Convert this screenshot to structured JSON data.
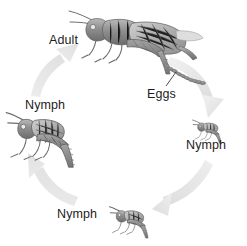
{
  "diagram": {
    "type": "life-cycle-diagram",
    "background_color": "#ffffff",
    "arrow_color": "#e6e6e6",
    "label_color": "#1d1d1d",
    "drawing_style": "grayscale pencil illustration",
    "cycle_direction": "clockwise",
    "labels": {
      "adult": "Adult",
      "eggs": "Eggs",
      "nymph_right": "Nymph",
      "nymph_bottom": "Nymph",
      "nymph_left": "Nymph"
    },
    "stages": [
      {
        "label": "Adult",
        "position": "top",
        "size": "largest",
        "facing": "left"
      },
      {
        "label": "Eggs",
        "position": "top-right",
        "size": "egg-cluster",
        "facing": "n/a"
      },
      {
        "label": "Nymph",
        "position": "right",
        "size": "smallest",
        "facing": "left"
      },
      {
        "label": "Nymph",
        "position": "bottom",
        "size": "small",
        "facing": "left"
      },
      {
        "label": "Nymph",
        "position": "left",
        "size": "medium",
        "facing": "left"
      }
    ],
    "arrows": [
      {
        "name": "adult-to-eggs-nymph",
        "from": "Eggs",
        "to": "Nymph (right)",
        "direction": "down-right"
      },
      {
        "name": "nymph-right-to-bottom",
        "from": "Nymph (right)",
        "to": "Nymph (bottom)",
        "direction": "left"
      },
      {
        "name": "nymph-bottom-to-left",
        "from": "Nymph (bottom)",
        "to": "Nymph (left)",
        "direction": "up"
      },
      {
        "name": "nymph-left-to-adult",
        "from": "Nymph (left)",
        "to": "Adult",
        "direction": "up-right"
      }
    ]
  }
}
